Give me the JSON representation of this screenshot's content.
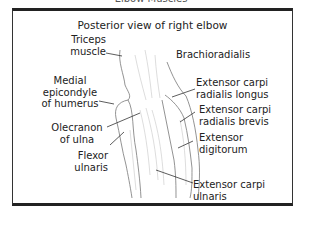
{
  "figure": {
    "clipped_title": "Elbow Muscles",
    "heading": "Posterior view of right elbow",
    "labels": {
      "triceps": [
        "Triceps",
        "muscle"
      ],
      "medial_epicondyle": [
        "Medial",
        "epicondyle",
        "of humerus"
      ],
      "olecranon": [
        "Olecranon",
        "of ulna"
      ],
      "flexor_ulnaris": [
        "Flexor",
        "ulnaris"
      ],
      "brachioradialis": [
        "Brachioradialis"
      ],
      "ecrl": [
        "Extensor carpi",
        "radialis longus"
      ],
      "ecrb": [
        "Extensor carpi",
        "radialis brevis"
      ],
      "ext_digitorum": [
        "Extensor",
        "digitorum"
      ],
      "ecu": [
        "Extensor carpi",
        "ulnaris"
      ]
    }
  }
}
